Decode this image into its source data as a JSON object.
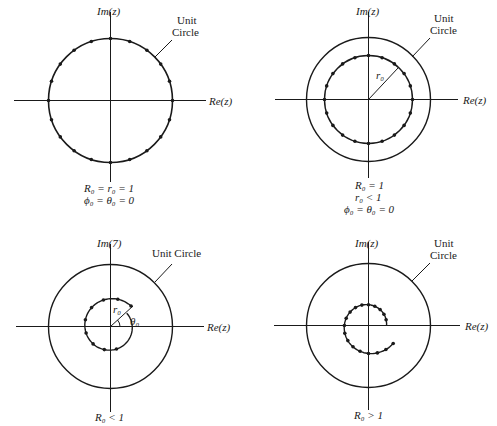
{
  "figure": {
    "axis_labels": {
      "imag": "Im(z)",
      "imag_alt": "Im(7)",
      "real": "Re(z)"
    },
    "unit_circle_label": "Unit Circle",
    "unit_circle_label_line1": "Unit",
    "unit_circle_label_line2": "Circle",
    "panels": [
      {
        "id": "top-left",
        "description": "Points on unit circle",
        "captions": [
          "R₀ = r₀ = 1",
          "ϕ₀ = θ₀ = 0"
        ],
        "radius_label": ""
      },
      {
        "id": "top-right",
        "description": "Points on circle of radius r0 inside unit circle",
        "captions": [
          "R₀ = 1",
          "r₀ < 1",
          "ϕ₀ = θ₀ = 0"
        ],
        "radius_label": "r₀"
      },
      {
        "id": "bottom-left",
        "description": "Inward spiral starting at r0, angle θ0",
        "captions": [
          "R₀ < 1"
        ],
        "radius_label": "r₀",
        "angle_label": "θ₀"
      },
      {
        "id": "bottom-right",
        "description": "Outward spiral",
        "captions": [
          "R₀ > 1"
        ]
      }
    ]
  }
}
